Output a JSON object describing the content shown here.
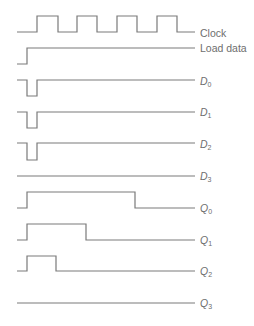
{
  "diagram": {
    "title": "",
    "line_color": "#7a7a7a",
    "label_color": "#6e6e6e",
    "signals": [
      {
        "name": "Clock",
        "letter": "",
        "sub": "",
        "label_y": 29,
        "path": "M17,32 H37 V16 H58 V32 H77 V16 H97 V32 H117 V16 H137 V32 H157 V16 H177 V32 H195"
      },
      {
        "name": "Load data",
        "letter": "",
        "sub": "",
        "label_y": 44,
        "path": "M17,64 H27 V48 H195"
      },
      {
        "name": "D0",
        "letter": "D",
        "sub": "0",
        "label_y": 79,
        "path": "M17,80 H27 V96 H37 V80 H195"
      },
      {
        "name": "D1",
        "letter": "D",
        "sub": "1",
        "label_y": 109,
        "path": "M17,112 H27 V128 H37 V112 H195"
      },
      {
        "name": "D2",
        "letter": "D",
        "sub": "2",
        "label_y": 141,
        "path": "M17,143 H27 V160 H37 V143 H195"
      },
      {
        "name": "D3",
        "letter": "D",
        "sub": "3",
        "label_y": 173,
        "path": "M17,176 H195"
      },
      {
        "name": "Q0",
        "letter": "Q",
        "sub": "0",
        "label_y": 206,
        "path": "M17,208 H27 V192 H135 V208 H195"
      },
      {
        "name": "Q1",
        "letter": "Q",
        "sub": "1",
        "label_y": 237,
        "path": "M17,240 H27 V224 H86 V240 H195"
      },
      {
        "name": "Q2",
        "letter": "Q",
        "sub": "2",
        "label_y": 268,
        "path": "M17,271 H27 V256 H56 V271 H195"
      },
      {
        "name": "Q3",
        "letter": "Q",
        "sub": "3",
        "label_y": 300,
        "path": "M17,303 H195"
      }
    ]
  },
  "labels": {
    "clock": "Clock",
    "load_data": "Load data",
    "d0": {
      "letter": "D",
      "sub": "0"
    },
    "d1": {
      "letter": "D",
      "sub": "1"
    },
    "d2": {
      "letter": "D",
      "sub": "2"
    },
    "d3": {
      "letter": "D",
      "sub": "3"
    },
    "q0": {
      "letter": "Q",
      "sub": "0"
    },
    "q1": {
      "letter": "Q",
      "sub": "1"
    },
    "q2": {
      "letter": "Q",
      "sub": "2"
    },
    "q3": {
      "letter": "Q",
      "sub": "3"
    }
  }
}
